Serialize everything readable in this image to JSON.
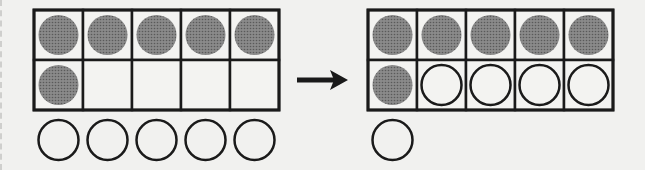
{
  "diagram": {
    "colors": {
      "filled": "#7a7a7a",
      "line": "#1a1a1a",
      "background": "#f1f1ef"
    },
    "left": {
      "frame": {
        "rows": 2,
        "cols": 5,
        "x": 34,
        "y": 10,
        "cell_w": 49,
        "cell_h": 50
      },
      "filled_cells": [
        [
          0,
          0
        ],
        [
          0,
          1
        ],
        [
          0,
          2
        ],
        [
          0,
          3
        ],
        [
          0,
          4
        ],
        [
          1,
          0
        ]
      ],
      "open_cells": [],
      "loose_counters": 5
    },
    "arrow": {
      "direction": "right"
    },
    "right": {
      "frame": {
        "rows": 2,
        "cols": 5,
        "x": 368,
        "y": 10,
        "cell_w": 49,
        "cell_h": 50
      },
      "filled_cells": [
        [
          0,
          0
        ],
        [
          0,
          1
        ],
        [
          0,
          2
        ],
        [
          0,
          3
        ],
        [
          0,
          4
        ],
        [
          1,
          0
        ]
      ],
      "open_cells": [
        [
          1,
          1
        ],
        [
          1,
          2
        ],
        [
          1,
          3
        ],
        [
          1,
          4
        ]
      ],
      "loose_counters": 1
    }
  }
}
